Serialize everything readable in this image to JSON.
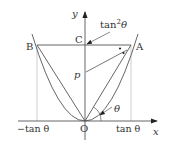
{
  "labels": {
    "y_axis": "y",
    "x_axis": "x",
    "origin": "O",
    "point_a": "A",
    "point_b": "B",
    "point_c": "C",
    "length_p": "p",
    "angle": "θ",
    "tan2": "tan",
    "tan2_exp": "2",
    "tan2_theta": "θ",
    "x_pos": "tan θ",
    "x_neg": "−tan θ"
  },
  "colors": {
    "line": "#555555",
    "guide": "#aaaaaa",
    "text": "#333333"
  }
}
